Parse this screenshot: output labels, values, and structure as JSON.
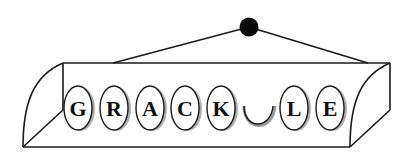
{
  "diagram": {
    "type": "word-tile-box",
    "tiles": [
      {
        "letter": "G",
        "cx": 78
      },
      {
        "letter": "R",
        "cx": 114
      },
      {
        "letter": "A",
        "cx": 150
      },
      {
        "letter": "C",
        "cx": 185
      },
      {
        "letter": "K",
        "cx": 221
      },
      {
        "letter": "",
        "cx": 259,
        "missing": true
      },
      {
        "letter": "L",
        "cx": 294
      },
      {
        "letter": "E",
        "cx": 330
      }
    ],
    "colors": {
      "stroke": "#1a1a1a",
      "tile_fill": "#ffffff",
      "tile_shadow": "#8a8a8a",
      "hanger_dot": "#0a0a0a",
      "background": "#ffffff"
    }
  }
}
